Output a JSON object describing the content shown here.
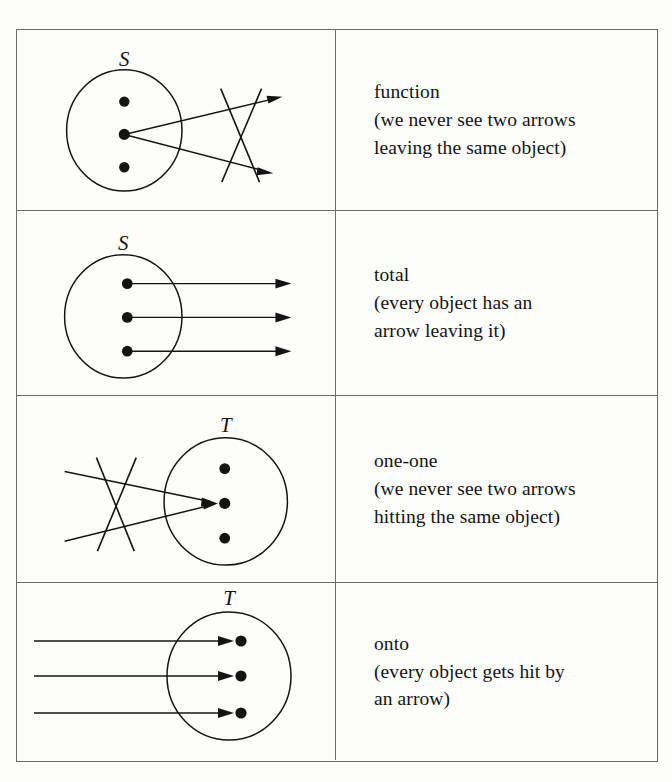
{
  "document": {
    "type": "table",
    "title": "Properties of relations between sets",
    "row_count": 4,
    "column_count": 2
  },
  "rows": [
    {
      "id": "function",
      "diagram": {
        "set_label": "S",
        "set_side": "left",
        "dot_count": 3,
        "arrow_count": 2,
        "arrow_origin": "middle-dot",
        "arrow_direction": "outgoing",
        "crossed_out": true,
        "description": "two arrows leaving the same middle object, crossed out"
      },
      "caption": {
        "term": "function",
        "line1": "(we never see two arrows",
        "line2": "leaving the same object)",
        "full": "function\n(we never see two arrows\nleaving the same object)"
      }
    },
    {
      "id": "total",
      "diagram": {
        "set_label": "S",
        "set_side": "left",
        "dot_count": 3,
        "arrow_count": 3,
        "arrow_origin": "each-dot",
        "arrow_direction": "outgoing",
        "crossed_out": false,
        "description": "every object has one arrow leaving it"
      },
      "caption": {
        "term": "total",
        "line1": "(every object has an",
        "line2": "arrow leaving it)",
        "full": "total\n(every object has an\narrow leaving it)"
      }
    },
    {
      "id": "one-one",
      "diagram": {
        "set_label": "T",
        "set_side": "right",
        "dot_count": 3,
        "arrow_count": 2,
        "arrow_origin": "middle-dot",
        "arrow_direction": "incoming",
        "crossed_out": true,
        "description": "two arrows hitting the same middle object, crossed out"
      },
      "caption": {
        "term": "one-one",
        "line1": "(we never see two arrows",
        "line2": "hitting the same object)",
        "full": "one-one\n(we never see two arrows\nhitting the same object)"
      }
    },
    {
      "id": "onto",
      "diagram": {
        "set_label": "T",
        "set_side": "right",
        "dot_count": 3,
        "arrow_count": 3,
        "arrow_origin": "each-dot",
        "arrow_direction": "incoming",
        "crossed_out": false,
        "description": "every object gets hit by one arrow"
      },
      "caption": {
        "term": "onto",
        "line1": "(every object gets hit by",
        "line2": "an arrow)",
        "full": "onto\n(every object gets hit by\nan arrow)"
      }
    }
  ],
  "colors": {
    "ink": "#141414",
    "rule": "#6a6a6a",
    "paper": "#fdfdfc"
  }
}
